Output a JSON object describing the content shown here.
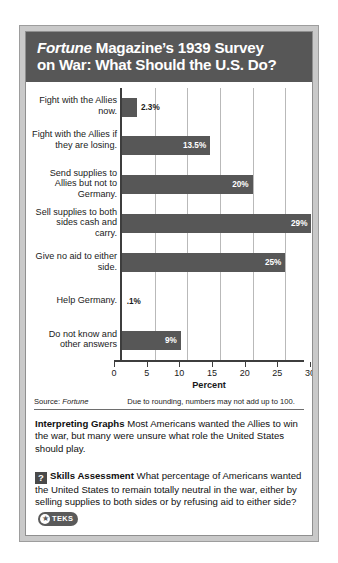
{
  "title": {
    "line1_em": "Fortune",
    "line1_rest": " Magazine’s 1939 Survey",
    "line2": "on War: What Should the U.S. Do?"
  },
  "chart_data": {
    "type": "bar",
    "orientation": "horizontal",
    "title": "Fortune Magazine’s 1939 Survey on War: What Should the U.S. Do?",
    "xlabel": "Percent",
    "ylabel": "",
    "xlim": [
      0,
      30
    ],
    "xticks": [
      0,
      5,
      10,
      15,
      20,
      25,
      30
    ],
    "xtick_labels": [
      "0",
      "5",
      "10",
      "15",
      "20",
      "25",
      "30"
    ],
    "grid": true,
    "legend": "none",
    "categories": [
      "Fight with the Allies now.",
      "Fight with the Allies if they are losing.",
      "Send supplies to Allies but not to Germany.",
      "Sell supplies to both sides cash and carry.",
      "Give no aid to either side.",
      "Help Germany.",
      "Do not know and other answers"
    ],
    "values": [
      2.3,
      13.5,
      20,
      29,
      25,
      0.1,
      9
    ],
    "value_labels": [
      "2.3%",
      "13.5%",
      "20%",
      "29%",
      "25%",
      ".1%",
      "9%"
    ],
    "bar_color": "#575757"
  },
  "source": {
    "label": "Source: ",
    "label_em": "Fortune",
    "note": "Due to rounding, numbers may not add up to 100."
  },
  "interpreting": {
    "heading": "Interpreting Graphs",
    "body": "Most Americans wanted the Allies to win the war, but many were unsure what role the United States should play."
  },
  "skills": {
    "icon": "question-mark-icon",
    "heading": "Skills Assessment",
    "body": "What percentage of Americans wanted the United States to remain totally neutral in the war, either by selling supplies to both sides or by refusing aid to either side?",
    "badge_star": "★",
    "badge_text": "TEKS"
  }
}
